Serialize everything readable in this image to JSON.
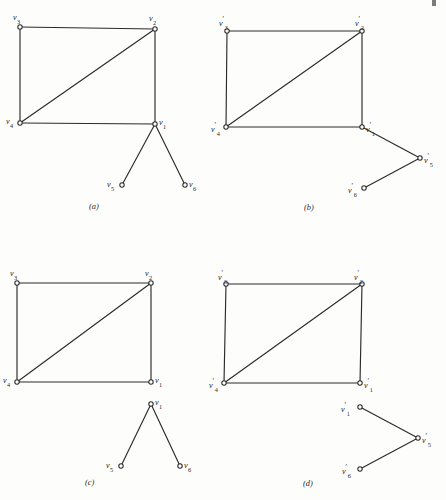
{
  "figure": {
    "kind": "graph-diagram",
    "background_color": "#fdfdfc",
    "ink_color": "#2b2b2b",
    "node_radius": 2.2,
    "panels": [
      {
        "id": "a",
        "caption": "(a)",
        "caption_pos": {
          "x": 89,
          "y": 203
        },
        "nodes": [
          {
            "id": "v3",
            "label_base": "v",
            "label_prime": "",
            "label_sub": "3",
            "x": 20,
            "y": 27,
            "label_x": 13,
            "label_y": 14,
            "label_align": "left"
          },
          {
            "id": "v2",
            "label_base": "v",
            "label_prime": "",
            "label_sub": "2",
            "x": 155,
            "y": 29,
            "label_x": 149,
            "label_y": 15,
            "label_align": "left"
          },
          {
            "id": "v4",
            "label_base": "v",
            "label_prime": "",
            "label_sub": "4",
            "x": 20,
            "y": 123,
            "label_x": 6,
            "label_y": 118,
            "label_align": "left"
          },
          {
            "id": "v1",
            "label_base": "v",
            "label_prime": "",
            "label_sub": "1",
            "x": 155,
            "y": 124,
            "label_x": 159,
            "label_y": 119,
            "label_align": "left"
          },
          {
            "id": "v5",
            "label_base": "v",
            "label_prime": "",
            "label_sub": "5",
            "x": 122,
            "y": 185,
            "label_x": 107,
            "label_y": 181,
            "label_align": "left"
          },
          {
            "id": "v6",
            "label_base": "v",
            "label_prime": "",
            "label_sub": "6",
            "x": 185,
            "y": 185,
            "label_x": 189,
            "label_y": 181,
            "label_align": "left"
          }
        ],
        "edges": [
          [
            "v3",
            "v2"
          ],
          [
            "v3",
            "v4"
          ],
          [
            "v2",
            "v1"
          ],
          [
            "v2",
            "v4"
          ],
          [
            "v4",
            "v1"
          ],
          [
            "v1",
            "v5"
          ],
          [
            "v1",
            "v6"
          ]
        ]
      },
      {
        "id": "b",
        "caption": "(b)",
        "caption_pos": {
          "x": 304,
          "y": 204
        },
        "nodes": [
          {
            "id": "v3p",
            "label_base": "v",
            "label_prime": "′",
            "label_sub": "3",
            "x": 227,
            "y": 31,
            "label_x": 219,
            "label_y": 16,
            "label_align": "left"
          },
          {
            "id": "v2p",
            "label_base": "v",
            "label_prime": "′",
            "label_sub": "2",
            "x": 362,
            "y": 31,
            "label_x": 355,
            "label_y": 16,
            "label_align": "left"
          },
          {
            "id": "v4p",
            "label_base": "v",
            "label_prime": "′",
            "label_sub": "4",
            "x": 226,
            "y": 127,
            "label_x": 211,
            "label_y": 122,
            "label_align": "left"
          },
          {
            "id": "v1p",
            "label_base": "v",
            "label_prime": "′",
            "label_sub": "1",
            "x": 362,
            "y": 127,
            "label_x": 366,
            "label_y": 122,
            "label_align": "left"
          },
          {
            "id": "v5p",
            "label_base": "v",
            "label_prime": "′",
            "label_sub": "5",
            "x": 420,
            "y": 158,
            "label_x": 424,
            "label_y": 153,
            "label_align": "left"
          },
          {
            "id": "v6p",
            "label_base": "v",
            "label_prime": "′",
            "label_sub": "6",
            "x": 364,
            "y": 188,
            "label_x": 348,
            "label_y": 183,
            "label_align": "left"
          }
        ],
        "edges": [
          [
            "v3p",
            "v2p"
          ],
          [
            "v3p",
            "v4p"
          ],
          [
            "v2p",
            "v1p"
          ],
          [
            "v2p",
            "v4p"
          ],
          [
            "v4p",
            "v1p"
          ],
          [
            "v1p",
            "v5p"
          ],
          [
            "v5p",
            "v6p"
          ]
        ]
      },
      {
        "id": "c",
        "caption": "(c)",
        "caption_pos": {
          "x": 85,
          "y": 479
        },
        "nodes": [
          {
            "id": "v3",
            "label_base": "v",
            "label_prime": "",
            "label_sub": "3",
            "x": 17,
            "y": 283,
            "label_x": 10,
            "label_y": 270,
            "label_align": "left"
          },
          {
            "id": "v2",
            "label_base": "v",
            "label_prime": "",
            "label_sub": "2",
            "x": 151,
            "y": 283,
            "label_x": 145,
            "label_y": 270,
            "label_align": "left"
          },
          {
            "id": "v4",
            "label_base": "v",
            "label_prime": "",
            "label_sub": "4",
            "x": 17,
            "y": 382,
            "label_x": 3,
            "label_y": 377,
            "label_align": "left"
          },
          {
            "id": "v1a",
            "label_base": "v",
            "label_prime": "",
            "label_sub": "1",
            "x": 151,
            "y": 382,
            "label_x": 155,
            "label_y": 377,
            "label_align": "left"
          },
          {
            "id": "v1b",
            "label_base": "v",
            "label_prime": "",
            "label_sub": "1",
            "x": 151,
            "y": 404,
            "label_x": 155,
            "label_y": 399,
            "label_align": "left"
          },
          {
            "id": "v5",
            "label_base": "v",
            "label_prime": "",
            "label_sub": "5",
            "x": 121,
            "y": 466,
            "label_x": 106,
            "label_y": 462,
            "label_align": "left"
          },
          {
            "id": "v6",
            "label_base": "v",
            "label_prime": "",
            "label_sub": "6",
            "x": 180,
            "y": 466,
            "label_x": 184,
            "label_y": 462,
            "label_align": "left"
          }
        ],
        "edges": [
          [
            "v3",
            "v2"
          ],
          [
            "v3",
            "v4"
          ],
          [
            "v2",
            "v1a"
          ],
          [
            "v2",
            "v4"
          ],
          [
            "v4",
            "v1a"
          ],
          [
            "v1b",
            "v5"
          ],
          [
            "v1b",
            "v6"
          ]
        ]
      },
      {
        "id": "d",
        "caption": "(d)",
        "caption_pos": {
          "x": 303,
          "y": 480
        },
        "nodes": [
          {
            "id": "v3p",
            "label_base": "v",
            "label_prime": "′",
            "label_sub": "3",
            "x": 226,
            "y": 284,
            "label_x": 218,
            "label_y": 270,
            "label_align": "left"
          },
          {
            "id": "v2p",
            "label_base": "v",
            "label_prime": "′",
            "label_sub": "2",
            "x": 362,
            "y": 284,
            "label_x": 354,
            "label_y": 270,
            "label_align": "left"
          },
          {
            "id": "v4p",
            "label_base": "v",
            "label_prime": "′",
            "label_sub": "4",
            "x": 224,
            "y": 383,
            "label_x": 209,
            "label_y": 378,
            "label_align": "left"
          },
          {
            "id": "v1pa",
            "label_base": "v",
            "label_prime": "′",
            "label_sub": "1",
            "x": 360,
            "y": 383,
            "label_x": 364,
            "label_y": 378,
            "label_align": "left"
          },
          {
            "id": "v1pb",
            "label_base": "v",
            "label_prime": "′",
            "label_sub": "1",
            "x": 360,
            "y": 407,
            "label_x": 341,
            "label_y": 402,
            "label_align": "left"
          },
          {
            "id": "v5p",
            "label_base": "v",
            "label_prime": "′",
            "label_sub": "5",
            "x": 418,
            "y": 438,
            "label_x": 422,
            "label_y": 433,
            "label_align": "left"
          },
          {
            "id": "v6p",
            "label_base": "v",
            "label_prime": "′",
            "label_sub": "6",
            "x": 360,
            "y": 469,
            "label_x": 342,
            "label_y": 464,
            "label_align": "left"
          }
        ],
        "edges": [
          [
            "v3p",
            "v2p"
          ],
          [
            "v3p",
            "v4p"
          ],
          [
            "v2p",
            "v1pa"
          ],
          [
            "v2p",
            "v4p"
          ],
          [
            "v4p",
            "v1pa"
          ],
          [
            "v1pb",
            "v5p"
          ],
          [
            "v5p",
            "v6p"
          ]
        ]
      }
    ],
    "artifact": {
      "x": 432,
      "y": 0,
      "w": 4,
      "h": 6
    }
  }
}
